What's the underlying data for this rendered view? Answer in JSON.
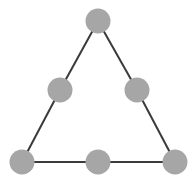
{
  "diagram": {
    "type": "graph",
    "shape": "triangle",
    "colors": {
      "node_fill": "#a6a6a6",
      "edge_stroke": "#3a3a3a",
      "background": "#ffffff"
    },
    "node_radius": 12.5,
    "nodes": [
      {
        "id": "top",
        "x": 98,
        "y": 21
      },
      {
        "id": "mid-left",
        "x": 60,
        "y": 90
      },
      {
        "id": "mid-right",
        "x": 137,
        "y": 90
      },
      {
        "id": "bottom-left",
        "x": 22,
        "y": 162
      },
      {
        "id": "bottom-mid",
        "x": 98,
        "y": 162
      },
      {
        "id": "bottom-right",
        "x": 175,
        "y": 162
      }
    ],
    "edges": [
      [
        "top",
        "mid-left"
      ],
      [
        "mid-left",
        "bottom-left"
      ],
      [
        "top",
        "mid-right"
      ],
      [
        "mid-right",
        "bottom-right"
      ],
      [
        "bottom-left",
        "bottom-mid"
      ],
      [
        "bottom-mid",
        "bottom-right"
      ]
    ]
  }
}
